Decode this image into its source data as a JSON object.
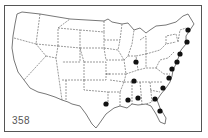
{
  "figure": {
    "number": "358"
  },
  "map": {
    "region": "Contiguous United States",
    "line_color": "#555555",
    "dot_color": "#111111",
    "dots": [
      {
        "label": "Maine",
        "x": 188,
        "y": 30
      },
      {
        "label": "New Hampshire / Massachusetts",
        "x": 187,
        "y": 42
      },
      {
        "label": "Connecticut / New York",
        "x": 180,
        "y": 54
      },
      {
        "label": "New Jersey",
        "x": 177,
        "y": 62
      },
      {
        "label": "Maryland / Delaware",
        "x": 172,
        "y": 69
      },
      {
        "label": "Virginia",
        "x": 169,
        "y": 78
      },
      {
        "label": "North Carolina",
        "x": 163,
        "y": 88
      },
      {
        "label": "Georgia",
        "x": 155,
        "y": 99
      },
      {
        "label": "Florida",
        "x": 160,
        "y": 111
      },
      {
        "label": "Alabama",
        "x": 138,
        "y": 98
      },
      {
        "label": "Mississippi",
        "x": 128,
        "y": 100
      },
      {
        "label": "Tennessee",
        "x": 134,
        "y": 81
      },
      {
        "label": "Indiana",
        "x": 136,
        "y": 62
      },
      {
        "label": "Texas",
        "x": 106,
        "y": 104
      }
    ]
  }
}
